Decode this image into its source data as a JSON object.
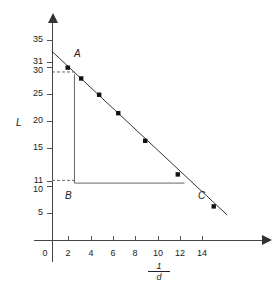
{
  "chart_data": {
    "type": "scatter",
    "title": "",
    "xlabel": "1/d",
    "xlabel_numerator": "1",
    "xlabel_denominator": "d",
    "ylabel": "L",
    "xlim": [
      0,
      16
    ],
    "ylim": [
      0,
      37
    ],
    "grid": false,
    "legend": "none",
    "x_ticks": [
      0,
      2,
      4,
      6,
      8,
      10,
      12,
      14
    ],
    "y_ticks": [
      5,
      10,
      15,
      20,
      25,
      30,
      35
    ],
    "y_extra_ticks": [
      11,
      31
    ],
    "y_tick_labels": [
      "5",
      "10",
      "11",
      "15",
      "20",
      "25",
      "30",
      "31",
      "35"
    ],
    "points": [
      {
        "x": 1.4,
        "y": 31.8
      },
      {
        "x": 2.6,
        "y": 29.8
      },
      {
        "x": 4.2,
        "y": 26.8
      },
      {
        "x": 5.9,
        "y": 23.4
      },
      {
        "x": 8.3,
        "y": 18.3
      },
      {
        "x": 11.2,
        "y": 12.1
      },
      {
        "x": 14.4,
        "y": 6.2
      }
    ],
    "fit_line": {
      "x_start": 0.0,
      "y_start": 34.8,
      "x_end": 15.6,
      "y_end": 4.6,
      "description": "line of best fit"
    },
    "annotations": [
      {
        "label": "A",
        "x": 2,
        "y": 30.6,
        "role": "triangle-vertex-top"
      },
      {
        "label": "B",
        "x": 2,
        "y": 10.5,
        "role": "triangle-vertex-corner"
      },
      {
        "label": "C",
        "x": 11.8,
        "y": 10.5,
        "role": "triangle-vertex-right"
      }
    ],
    "construction": {
      "vertical_line": {
        "x": 2,
        "y_from": 10.5,
        "y_to": 30.6
      },
      "horizontal_line": {
        "y": 10.5,
        "x_from": 2,
        "x_to": 11.8
      },
      "dashed_guides": [
        {
          "from_axis": "y",
          "value": 31,
          "to_x": 2
        },
        {
          "from_axis": "y",
          "value": 11,
          "to_x": 2
        }
      ]
    }
  },
  "labels": {
    "y_35": "35",
    "y_31": "31",
    "y_30": "30",
    "y_25": "25",
    "y_20": "20",
    "y_15": "15",
    "y_11": "11",
    "y_10": "10",
    "y_5": "5",
    "x_0": "0",
    "x_2": "2",
    "x_4": "4",
    "x_6": "6",
    "x_8": "8",
    "x_10": "10",
    "x_12": "12",
    "x_14": "14",
    "axis_y": "L",
    "point_a": "A",
    "point_b": "B",
    "point_c": "C"
  },
  "colors": {
    "axis": "#444444",
    "point": "#111111",
    "line": "#333333",
    "guide": "#666666",
    "background": "#ffffff"
  }
}
